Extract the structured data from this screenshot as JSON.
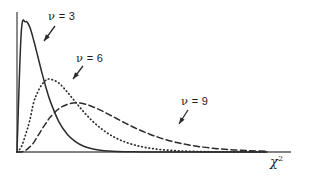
{
  "figure": {
    "background_color": "#ffffff",
    "ink_color": "#2b2b2b",
    "axis_color": "#595959"
  },
  "chart_data": {
    "type": "line",
    "title": "",
    "subtitle": "",
    "xlabel": "χ²",
    "ylabel": "",
    "xlim": [
      0,
      30
    ],
    "ylim": [
      0,
      0.26
    ],
    "grid": false,
    "legend_position": "inline-annotations",
    "x": [
      0,
      0.5,
      1,
      1.5,
      2,
      2.5,
      3,
      3.5,
      4,
      5,
      6,
      7,
      8,
      9,
      10,
      11,
      12,
      13,
      14,
      15,
      16,
      17,
      18,
      19,
      20,
      22,
      24,
      26,
      28,
      30
    ],
    "series": [
      {
        "name": "ν = 3",
        "df": 3,
        "style": "solid",
        "peak_x": 1,
        "peak_y": 0.242,
        "values": [
          0,
          0.2196,
          0.242,
          0.2332,
          0.2076,
          0.1773,
          0.1465,
          0.1185,
          0.094,
          0.0569,
          0.0334,
          0.0191,
          0.0107,
          0.0059,
          0.0032,
          0.0017,
          0.0009,
          0.0005,
          0.0003,
          0.0001,
          0.0001,
          0.0,
          0.0,
          0.0,
          0.0,
          0.0,
          0.0,
          0.0,
          0.0,
          0.0
        ]
      },
      {
        "name": "ν = 6",
        "df": 6,
        "style": "dotted",
        "peak_x": 4,
        "peak_y": 0.1353,
        "values": [
          0,
          0.0091,
          0.0307,
          0.0567,
          0.092,
          0.1119,
          0.1255,
          0.1336,
          0.1353,
          0.1283,
          0.112,
          0.0931,
          0.0746,
          0.0583,
          0.0446,
          0.0336,
          0.025,
          0.0184,
          0.0134,
          0.0097,
          0.0069,
          0.0049,
          0.0035,
          0.0024,
          0.0017,
          0.0008,
          0.0004,
          0.0002,
          0.0001,
          0.0
        ]
      },
      {
        "name": "ν = 9",
        "df": 9,
        "style": "dashed",
        "peak_x": 7,
        "peak_y": 0.0914,
        "values": [
          0,
          0.0002,
          0.0029,
          0.009,
          0.0174,
          0.03,
          0.0424,
          0.054,
          0.0648,
          0.08,
          0.0881,
          0.0914,
          0.0895,
          0.0845,
          0.0778,
          0.0699,
          0.0617,
          0.0536,
          0.0459,
          0.0389,
          0.0326,
          0.0271,
          0.0223,
          0.0183,
          0.0149,
          0.0097,
          0.0062,
          0.0039,
          0.0024,
          0.0015
        ]
      }
    ],
    "annotations": [
      {
        "id": "nu3",
        "text_nu": "ν",
        "text_rest": " = 3",
        "label_x": 48,
        "label_y": 10,
        "arrow_from_x": 55,
        "arrow_from_y": 26,
        "arrow_to_x": 44,
        "arrow_to_y": 41,
        "points_to_series": "ν = 3"
      },
      {
        "id": "nu6",
        "text_nu": "ν",
        "text_rest": " = 6",
        "label_x": 76,
        "label_y": 52,
        "arrow_from_x": 83,
        "arrow_from_y": 66,
        "arrow_to_x": 73,
        "arrow_to_y": 79,
        "points_to_series": "ν = 6"
      },
      {
        "id": "nu9",
        "text_nu": "ν",
        "text_rest": " = 9",
        "label_x": 181,
        "label_y": 95,
        "arrow_from_x": 188,
        "arrow_from_y": 110,
        "arrow_to_x": 179,
        "arrow_to_y": 124,
        "points_to_series": "ν = 9"
      }
    ]
  },
  "axes": {
    "y_axis": {
      "x": 17,
      "y_top": 12,
      "y_bottom": 152
    },
    "x_axis": {
      "y": 152,
      "x_left": 17,
      "x_right": 291
    },
    "x_label_text": "χ",
    "x_label_exponent": "2"
  }
}
